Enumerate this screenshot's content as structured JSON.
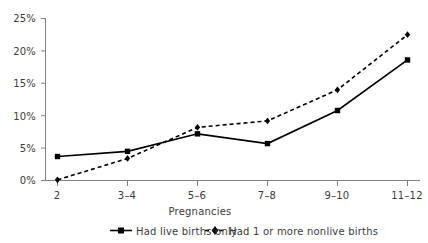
{
  "chart_data": {
    "type": "line",
    "title": "",
    "subtitle": "",
    "xlabel": "Pregnancies",
    "ylabel": "",
    "categories": [
      "2",
      "3–4",
      "5–6",
      "7–8",
      "9–10",
      "11–12"
    ],
    "series": [
      {
        "name": "Had live births only",
        "values": [
          3.7,
          4.5,
          7.2,
          5.7,
          10.8,
          18.6
        ],
        "line_style": "solid",
        "marker": "square",
        "color": "#000000"
      },
      {
        "name": "Had 1 or more nonlive births",
        "values": [
          0.1,
          3.4,
          8.2,
          9.2,
          14.0,
          22.5
        ],
        "line_style": "dashed",
        "marker": "diamond",
        "color": "#000000"
      }
    ],
    "ylim": [
      0,
      25
    ],
    "yticks": [
      0,
      5,
      10,
      15,
      20,
      25
    ],
    "ytick_labels": [
      "0%",
      "5%",
      "10%",
      "15%",
      "20%",
      "25%"
    ],
    "grid": false,
    "legend_position": "bottom"
  },
  "axes": {
    "y_labels": [
      "25%",
      "20%",
      "15%",
      "10%",
      "5%",
      "0%"
    ],
    "x_labels": [
      "2",
      "3–4",
      "5–6",
      "7–8",
      "9–10",
      "11–12"
    ],
    "x_title": "Pregnancies"
  },
  "legend": {
    "entries": [
      {
        "label": "Had live births only",
        "marker": "square-solid-line"
      },
      {
        "label": "Had 1 or more nonlive births",
        "marker": "diamond-dashed-line"
      }
    ]
  },
  "colors": {
    "ink": "#000000",
    "axis": "#808080",
    "text": "#3b3b3b",
    "background": "#ffffff"
  }
}
